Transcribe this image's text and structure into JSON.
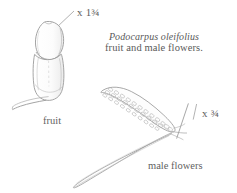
{
  "plate": {
    "background_color": "#ffffff",
    "ink_color": "#8c8c8c",
    "text_color": "#5f5f5f",
    "caption": {
      "scientific_name": "Podocarpus oleifolius",
      "description": "fruit and male flowers."
    },
    "magnifications": [
      {
        "id": "fruit",
        "prefix": "x",
        "value": "1¾",
        "full": "x 1¾"
      },
      {
        "id": "male-flowers",
        "prefix": "x",
        "value": "¾",
        "full": "x ¾"
      }
    ],
    "labels": {
      "fruit": "fruit",
      "male_flowers": "male flowers"
    },
    "figures": [
      {
        "name": "fruit-figure",
        "parts": [
          "seed",
          "receptacle",
          "peduncle"
        ]
      },
      {
        "name": "male-flowers-figure",
        "parts": [
          "pollen-cone",
          "cone-scales",
          "leaf",
          "leaf-midrib",
          "peduncle"
        ]
      }
    ]
  }
}
